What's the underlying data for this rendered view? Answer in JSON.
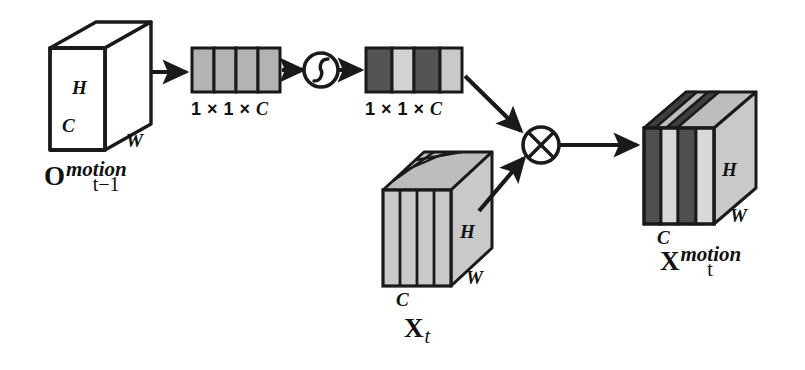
{
  "figure": {
    "background": "#ffffff",
    "stroke_color": "#1a1a1a"
  },
  "palette": {
    "outline": "#1a1a1a",
    "cube_face": "#ffffff",
    "vector_cell_mid": "#b3b3b3",
    "vector_cell_dark": "#545454",
    "vector_cell_light": "#d2d2d2",
    "slab_face_light": "#c9c9c9",
    "slab_slice_light": "#d8d8d8",
    "slab_slice_dark": "#4f4f4f",
    "slab_top_light": "#bdbdbd",
    "slab_top_dark": "#3f3f3f"
  },
  "input_cube": {
    "name": "input-motion-cube",
    "dim_h": "H",
    "dim_c": "C",
    "dim_w": "W",
    "caption": {
      "base": "O",
      "superscript": "motion",
      "subscript": "t−1"
    }
  },
  "descriptor_vector": {
    "name": "pooled-descriptor-vector",
    "caption_prefix": "1 × 1 × ",
    "caption_var": "C",
    "cells": [
      {
        "index": 0,
        "shade": "#b3b3b3",
        "level": "mid"
      },
      {
        "index": 1,
        "shade": "#b3b3b3",
        "level": "mid"
      },
      {
        "index": 2,
        "shade": "#b3b3b3",
        "level": "mid"
      },
      {
        "index": 3,
        "shade": "#b3b3b3",
        "level": "mid"
      }
    ]
  },
  "activation": {
    "name": "sigmoid-activation-node",
    "symbol": "sigmoid",
    "label": "σ"
  },
  "attention_vector": {
    "name": "channel-attention-weight-vector",
    "caption_prefix": "1 × 1 × ",
    "caption_var": "C",
    "cells": [
      {
        "index": 0,
        "shade": "#545454",
        "level": "dark"
      },
      {
        "index": 1,
        "shade": "#d2d2d2",
        "level": "light"
      },
      {
        "index": 2,
        "shade": "#545454",
        "level": "dark"
      },
      {
        "index": 3,
        "shade": "#c9c9c9",
        "level": "light"
      }
    ]
  },
  "feature_slab": {
    "name": "input-feature-slab",
    "dim_h": "H",
    "dim_c": "C",
    "dim_w": "W",
    "caption": {
      "base": "X",
      "subscript": "t"
    },
    "slices": [
      {
        "index": 0,
        "shade": "#c9c9c9",
        "level": "light"
      },
      {
        "index": 1,
        "shade": "#c9c9c9",
        "level": "light"
      },
      {
        "index": 2,
        "shade": "#c9c9c9",
        "level": "light"
      },
      {
        "index": 3,
        "shade": "#c9c9c9",
        "level": "light"
      }
    ]
  },
  "multiply": {
    "name": "elementwise-multiply-node",
    "symbol": "⊗",
    "label": "multiply"
  },
  "output_slab": {
    "name": "output-motion-feature-slab",
    "dim_h": "H",
    "dim_c": "C",
    "dim_w": "W",
    "caption": {
      "base": "X",
      "superscript": "motion",
      "subscript": "t"
    },
    "slices": [
      {
        "index": 0,
        "shade": "#4f4f4f",
        "level": "dark"
      },
      {
        "index": 1,
        "shade": "#d8d8d8",
        "level": "light"
      },
      {
        "index": 2,
        "shade": "#4f4f4f",
        "level": "dark"
      },
      {
        "index": 3,
        "shade": "#d8d8d8",
        "level": "light"
      }
    ]
  },
  "arrows": [
    {
      "name": "arrow-cube-to-descriptor",
      "from": "input_cube",
      "to": "descriptor_vector",
      "direction": "right"
    },
    {
      "name": "arrow-descriptor-to-sigmoid",
      "from": "descriptor_vector",
      "to": "activation",
      "direction": "right"
    },
    {
      "name": "arrow-sigmoid-to-attention",
      "from": "activation",
      "to": "attention_vector",
      "direction": "right"
    },
    {
      "name": "arrow-attention-to-multiply",
      "from": "attention_vector",
      "to": "multiply",
      "direction": "down-right"
    },
    {
      "name": "arrow-slab-to-multiply",
      "from": "feature_slab",
      "to": "multiply",
      "direction": "up-right"
    },
    {
      "name": "arrow-multiply-to-output",
      "from": "multiply",
      "to": "output_slab",
      "direction": "right"
    }
  ]
}
